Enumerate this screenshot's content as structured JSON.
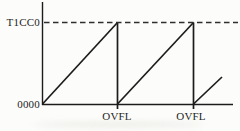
{
  "diagram": {
    "labels": {
      "compare_top": "T1CC0",
      "counter_min": "0000",
      "overflow_1": "OVFL",
      "overflow_2": "OVFL"
    },
    "colors": {
      "line": "#1c1c1c",
      "dash": "#2e2e2e",
      "text": "#1c1c1c",
      "background": "#fcfcfa"
    },
    "waveform": {
      "type": "sawtooth",
      "full_cycles": 2,
      "partial_cycle_at_end": true,
      "min_value_label": "0000",
      "max_value_label": "T1CC0",
      "overflow_event_count": 2
    },
    "segments": [
      {
        "name": "y-axis",
        "x1": 42.5,
        "y1": 2,
        "x2": 42.5,
        "y2": 105,
        "w": 1.4
      },
      {
        "name": "x-axis",
        "x1": 42,
        "y1": 104.5,
        "x2": 233,
        "y2": 104.5,
        "w": 1.4
      },
      {
        "name": "t1cc0-dashed-line",
        "x1": 44,
        "y1": 22.5,
        "x2": 238,
        "y2": 22.5,
        "w": 1.6,
        "dash": "5.5 3.5",
        "dashColor": true
      },
      {
        "name": "ramp-1",
        "x1": 42.5,
        "y1": 104,
        "x2": 117.5,
        "y2": 22.5,
        "w": 1.7
      },
      {
        "name": "overflow-drop-1",
        "x1": 117.5,
        "y1": 22.5,
        "x2": 117.5,
        "y2": 109,
        "w": 1.7
      },
      {
        "name": "ramp-2",
        "x1": 117.5,
        "y1": 104,
        "x2": 193.5,
        "y2": 22.5,
        "w": 1.7
      },
      {
        "name": "overflow-drop-2",
        "x1": 193.5,
        "y1": 22.5,
        "x2": 193.5,
        "y2": 109,
        "w": 1.7
      },
      {
        "name": "ramp-3-partial",
        "x1": 193.5,
        "y1": 104,
        "x2": 222,
        "y2": 77,
        "w": 1.7
      }
    ]
  }
}
